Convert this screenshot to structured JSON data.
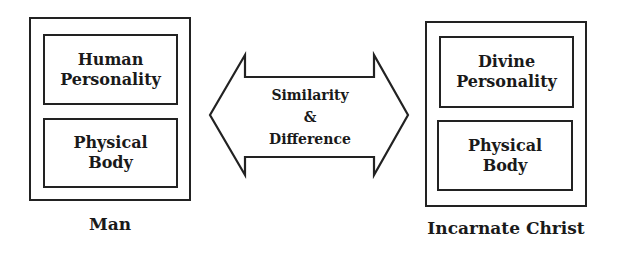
{
  "diagram": {
    "left": {
      "top_box": [
        "Human",
        "Personality"
      ],
      "bottom_box": [
        "Physical",
        "Body"
      ],
      "caption": "Man"
    },
    "right": {
      "top_box": [
        "Divine",
        "Personality"
      ],
      "bottom_box": [
        "Physical",
        "Body"
      ],
      "caption": "Incarnate Christ"
    },
    "arrow": {
      "lines": [
        "Similarity",
        "&",
        "Difference"
      ],
      "type": "double-headed-arrow"
    },
    "colors": {
      "stroke": "#222222",
      "background": "#ffffff"
    }
  }
}
